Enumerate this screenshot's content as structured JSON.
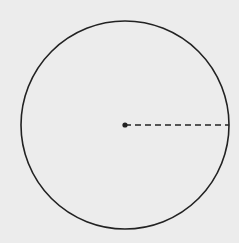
{
  "diagram": {
    "type": "circle-with-radius",
    "background_color": "#ececec",
    "stroke_color": "#222222",
    "circle": {
      "cx": 125,
      "cy": 125,
      "r": 104,
      "stroke_width": 1.6
    },
    "center_point": {
      "cx": 125,
      "cy": 125,
      "r": 2.6
    },
    "radius_line": {
      "x1": 125,
      "y1": 125,
      "x2": 229,
      "y2": 125,
      "style": "dashed",
      "dash": "6 4",
      "stroke_width": 1.6
    }
  }
}
